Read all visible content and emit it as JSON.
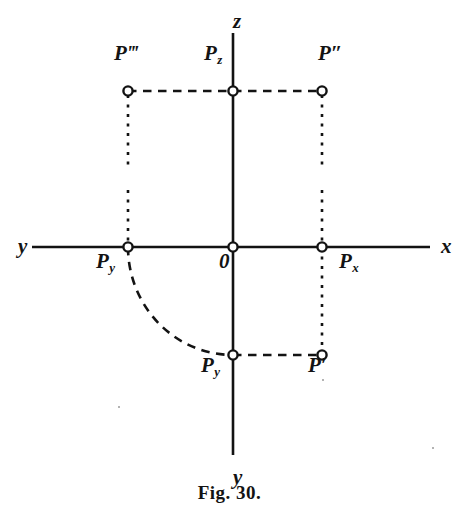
{
  "figure": {
    "caption": "Fig. 30.",
    "ink_color": "#131313",
    "background_color": "#ffffff",
    "width": 459,
    "height": 514
  },
  "axes": [
    {
      "name": "z-axis",
      "label": "z",
      "label_x": 233,
      "label_y": 22,
      "from": [
        233,
        247
      ],
      "to": [
        233,
        33
      ]
    },
    {
      "name": "y-axis-down",
      "label": "y",
      "label_x": 233,
      "label_y": 478,
      "from": [
        233,
        247
      ],
      "to": [
        233,
        455
      ]
    },
    {
      "name": "x-axis-right",
      "label": "x",
      "label_x": 441,
      "label_y": 247,
      "from": [
        233,
        247
      ],
      "to": [
        430,
        247
      ]
    },
    {
      "name": "y-axis-left",
      "label": "y",
      "label_x": 18,
      "label_y": 247,
      "from": [
        233,
        247
      ],
      "to": [
        32,
        247
      ]
    }
  ],
  "points": [
    {
      "id": "origin",
      "label": "0",
      "sub": "",
      "primes": "",
      "x": 233,
      "y": 247,
      "label_x": 219,
      "label_y": 262
    },
    {
      "id": "p-triple-prime",
      "label": "P",
      "sub": "",
      "primes": "‴",
      "x": 128,
      "y": 91,
      "label_x": 114,
      "label_y": 54
    },
    {
      "id": "p-z",
      "label": "P",
      "sub": "z",
      "primes": "",
      "x": 233,
      "y": 91,
      "label_x": 204,
      "label_y": 54
    },
    {
      "id": "p-double-prime",
      "label": "P",
      "sub": "",
      "primes": "″",
      "x": 322,
      "y": 91,
      "label_x": 318,
      "label_y": 54
    },
    {
      "id": "p-y-axis",
      "label": "P",
      "sub": "y",
      "primes": "",
      "x": 128,
      "y": 247,
      "label_x": 96,
      "label_y": 262
    },
    {
      "id": "p-x-axis",
      "label": "P",
      "sub": "x",
      "primes": "",
      "x": 322,
      "y": 247,
      "label_x": 339,
      "label_y": 262
    },
    {
      "id": "p-y-lower",
      "label": "P",
      "sub": "y",
      "primes": "",
      "x": 233,
      "y": 355,
      "label_x": 201,
      "label_y": 366
    },
    {
      "id": "p-prime",
      "label": "P",
      "sub": "",
      "primes": "′",
      "x": 322,
      "y": 355,
      "label_x": 308,
      "label_y": 366
    }
  ],
  "construction_lines": [
    {
      "name": "dashed-top-left",
      "style": "dashed",
      "from": [
        128,
        91
      ],
      "to": [
        233,
        91
      ]
    },
    {
      "name": "dashed-top-right",
      "style": "dashed",
      "from": [
        233,
        91
      ],
      "to": [
        322,
        91
      ]
    },
    {
      "name": "dotted-drop-left",
      "style": "dotted",
      "from": [
        128,
        95
      ],
      "to": [
        128,
        166
      ]
    },
    {
      "name": "dotted-drop-right",
      "style": "dotted",
      "from": [
        322,
        95
      ],
      "to": [
        322,
        166
      ]
    },
    {
      "name": "dotted-rise-py",
      "style": "dotted",
      "from": [
        128,
        190
      ],
      "to": [
        128,
        247
      ]
    },
    {
      "name": "dotted-px-to-pprime",
      "style": "dotted",
      "from": [
        322,
        190
      ],
      "to": [
        322,
        351
      ]
    },
    {
      "name": "dashed-bottom",
      "style": "dashed",
      "from": [
        233,
        355
      ],
      "to": [
        322,
        355
      ]
    }
  ],
  "arc": {
    "name": "rotation-arc",
    "style": "dashed",
    "from": [
      128,
      247
    ],
    "to": [
      233,
      355
    ],
    "center": [
      233,
      247
    ],
    "rx": 105,
    "ry": 108
  },
  "specks": [
    {
      "x": 118,
      "y": 406
    },
    {
      "x": 322,
      "y": 379
    },
    {
      "x": 432,
      "y": 447
    }
  ]
}
